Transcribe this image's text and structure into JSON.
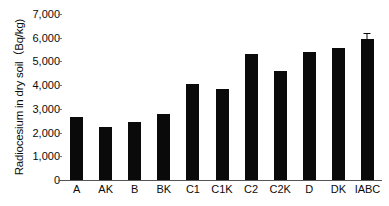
{
  "chart_data": {
    "type": "bar",
    "title": "",
    "subtitle": "",
    "xlabel": "",
    "ylabel": "Radiocesium in dry soil（Bq/kg)",
    "categories": [
      "A",
      "AK",
      "B",
      "BK",
      "C1",
      "C1K",
      "C2",
      "C2K",
      "D",
      "DK",
      "IABC"
    ],
    "values": [
      2650,
      2250,
      2450,
      2800,
      4050,
      3850,
      5300,
      4580,
      5400,
      5570,
      5940
    ],
    "errors": [
      null,
      null,
      null,
      null,
      null,
      null,
      null,
      null,
      null,
      null,
      210
    ],
    "ylim": [
      0,
      7000
    ],
    "ytick_values": [
      0,
      1000,
      2000,
      3000,
      4000,
      5000,
      6000,
      7000
    ],
    "ytick_labels": [
      "0",
      "1,000",
      "2,000",
      "3,000",
      "4,000",
      "5,000",
      "6,000",
      "7,000"
    ],
    "grid": false,
    "legend": false,
    "legend_position": "none",
    "bar_color": "#0a0a0a",
    "axis_color": "#555555",
    "background_color": "#ffffff",
    "series": [
      {
        "name": "Radiocesium in dry soil",
        "values": [
          2650,
          2250,
          2450,
          2800,
          4050,
          3850,
          5300,
          4580,
          5400,
          5570,
          5940
        ]
      }
    ]
  }
}
